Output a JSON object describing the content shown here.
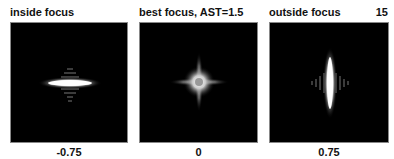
{
  "figure_number": "15",
  "panels": [
    {
      "title": "inside focus",
      "defocus_label": "-0.75",
      "shape": "horizontal-elongated"
    },
    {
      "title": "best focus, AST=1.5",
      "defocus_label": "0",
      "shape": "cross-star"
    },
    {
      "title": "outside focus",
      "defocus_label": "0.75",
      "shape": "vertical-elongated"
    }
  ]
}
